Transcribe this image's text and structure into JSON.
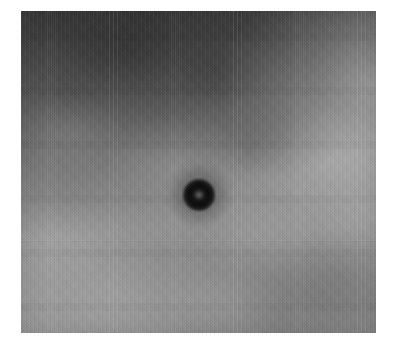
{
  "page": {
    "background_color": "#ffffff",
    "width": 397,
    "height": 350
  },
  "figure": {
    "name": "grayscale-micrograph",
    "caption": "",
    "panel": {
      "left": 21,
      "top": 11,
      "width": 355,
      "height": 322,
      "border_color": "#ffffff",
      "background_color": "#8d8d8d"
    },
    "features": [
      {
        "name": "central-dark-spot",
        "shape": "ring",
        "center_x": 199,
        "center_y": 195,
        "diameter": 32,
        "core_color": "#0a0a0a",
        "halo_color": "#2d2d2d",
        "label": ""
      }
    ],
    "tones": {
      "darkest": "#4e4e4e",
      "mid": "#8a8a8a",
      "lightest": "#b9b9b9",
      "top_left_region": "#5d5d5d",
      "upper_right_highlight": "#b4b4b4",
      "lower_region": "#929292"
    },
    "texture": {
      "type": "vertical-scanlines",
      "seam_y": 240,
      "grain": "fine"
    }
  }
}
